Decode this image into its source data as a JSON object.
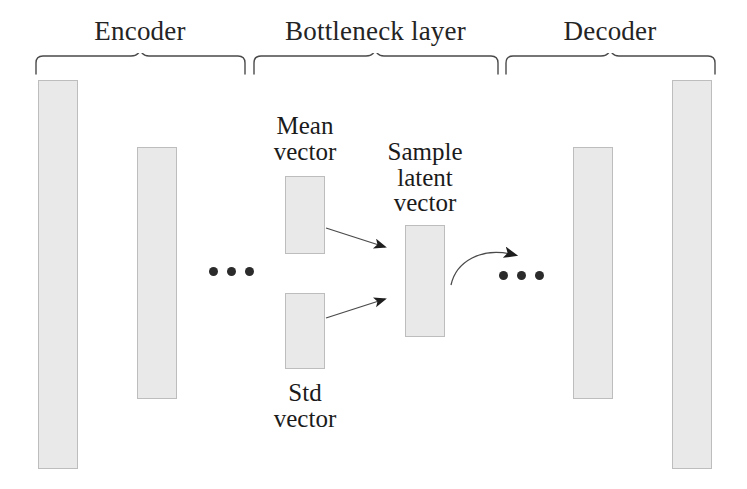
{
  "figure": {
    "type": "diagram",
    "background_color": "#ffffff",
    "bar_fill_color": "#e9e9e9",
    "bar_border_color": "#bdbdbd",
    "ink_color": "#1a1a1a"
  },
  "sections": [
    {
      "id": "encoder",
      "label": "Encoder"
    },
    {
      "id": "bottleneck",
      "label": "Bottleneck layer"
    },
    {
      "id": "decoder",
      "label": "Decoder"
    }
  ],
  "vectors": [
    {
      "id": "input-layer",
      "label": ""
    },
    {
      "id": "encoder-hidden",
      "label": ""
    },
    {
      "id": "mean-vector",
      "label": "Mean\nvector"
    },
    {
      "id": "std-vector",
      "label": "Std\nvector"
    },
    {
      "id": "sample-latent",
      "label": "Sample\nlatent\nvector"
    },
    {
      "id": "decoder-hidden",
      "label": ""
    },
    {
      "id": "output-layer",
      "label": ""
    }
  ],
  "labels": {
    "mean_vector_line1": "Mean",
    "mean_vector_line2": "vector",
    "std_vector_line1": "Std",
    "std_vector_line2": "vector",
    "sample_latent_line1": "Sample",
    "sample_latent_line2": "latent",
    "sample_latent_line3": "vector"
  },
  "ellipses": [
    {
      "id": "encoder-ellipsis",
      "dots": 3
    },
    {
      "id": "decoder-ellipsis",
      "dots": 3
    }
  ],
  "arrows": [
    {
      "id": "mean-to-sample",
      "from": "mean-vector",
      "to": "sample-latent",
      "style": "straight"
    },
    {
      "id": "std-to-sample",
      "from": "std-vector",
      "to": "sample-latent",
      "style": "straight"
    },
    {
      "id": "sample-to-decoder",
      "from": "sample-latent",
      "to": "decoder-ellipsis",
      "style": "curved"
    }
  ]
}
